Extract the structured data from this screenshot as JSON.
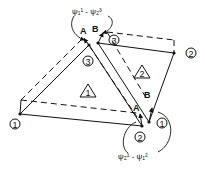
{
  "diagram": {
    "elements": [
      {
        "id": "1",
        "label": "1"
      },
      {
        "id": "2",
        "label": "2"
      }
    ],
    "node_labels": {
      "t1_left": "1",
      "t1_bottom": "2",
      "t1_top": "3",
      "t2_right": "2",
      "t2_bottom": "1",
      "t2_top": "3"
    },
    "edge_labels": {
      "top_A": "A",
      "top_B": "B",
      "bottom_A": "A",
      "bottom_B": "B"
    },
    "annotations": {
      "top": "ψ₁¹ - ψ₂³",
      "bottom": "ψ₂¹ - ψ₁²"
    },
    "colors": {
      "stroke": "#111111",
      "background": "#ffffff"
    }
  }
}
